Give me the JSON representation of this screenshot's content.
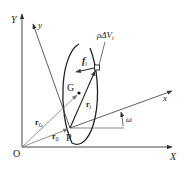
{
  "diagram": {
    "labels": {
      "origin": "O",
      "global_x": "X",
      "global_y": "Y",
      "body_x": "x",
      "body_y": "y",
      "center_of_mass": "G",
      "reference_point": "P",
      "r_G": "r",
      "r_G_sub": "G",
      "r_0": "r",
      "r_0_sub": "0",
      "r_i": "r",
      "r_i_sub": "i",
      "f_i": "f",
      "f_i_sub": "i",
      "mass_element": "ρΔV",
      "mass_element_sub": "i",
      "angle": "ω"
    },
    "colors": {
      "line": "#333333",
      "light_line": "#888888",
      "text": "#222222",
      "background": "#ffffff"
    }
  }
}
